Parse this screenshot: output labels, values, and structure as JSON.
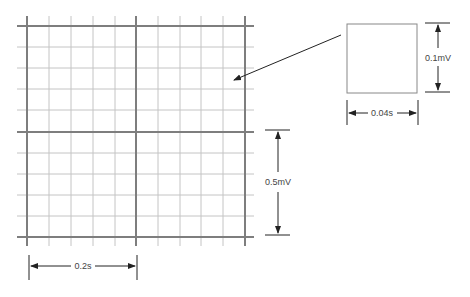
{
  "diagram": {
    "grid": {
      "large_box_time": "0.2s",
      "large_box_voltage": "0.5mV",
      "small_box_time": "0.04s",
      "small_box_voltage": "0.1mV",
      "small_boxes_per_large": 5,
      "colors": {
        "thin": "#bdbdbd",
        "thick": "#808080",
        "annotation": "#222222"
      }
    },
    "labels": {
      "horizontal_large": "0.2s",
      "vertical_large": "0.5mV",
      "horizontal_small": "0.04s",
      "vertical_small": "0.1mV"
    }
  }
}
